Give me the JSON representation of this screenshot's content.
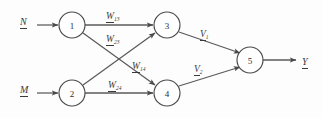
{
  "figure": {
    "width": 322,
    "height": 118,
    "background_color": "#fdfdfd",
    "line_color": "#5a5a5a",
    "text_color": "#3a3a3a"
  },
  "inputs": [
    {
      "name": "input-n",
      "label": "N",
      "underlined": true,
      "x": 24,
      "y": 18
    },
    {
      "name": "input-m",
      "label": "M",
      "underlined": true,
      "x": 24,
      "y": 86
    }
  ],
  "nodes": [
    {
      "id": "1",
      "label": "1",
      "cx": 72,
      "cy": 25,
      "r": 13
    },
    {
      "id": "2",
      "label": "2",
      "cx": 72,
      "cy": 93,
      "r": 13
    },
    {
      "id": "3",
      "label": "3",
      "cx": 167,
      "cy": 25,
      "r": 13
    },
    {
      "id": "4",
      "label": "4",
      "cx": 167,
      "cy": 93,
      "r": 13
    },
    {
      "id": "5",
      "label": "5",
      "cx": 250,
      "cy": 60,
      "r": 13
    }
  ],
  "weights": [
    {
      "name": "weight-w13",
      "base": "W",
      "sub": "13",
      "from": "1",
      "to": "3",
      "x": 112,
      "y": 7
    },
    {
      "name": "weight-w23",
      "base": "W",
      "sub": "23",
      "from": "2",
      "to": "3",
      "x": 112,
      "y": 30
    },
    {
      "name": "weight-w14",
      "base": "W",
      "sub": "14",
      "from": "1",
      "to": "4",
      "x": 138,
      "y": 57
    },
    {
      "name": "weight-w24",
      "base": "W",
      "sub": "24",
      "from": "2",
      "to": "4",
      "x": 114,
      "y": 76
    },
    {
      "name": "weight-v1",
      "base": "V",
      "sub": "1",
      "from": "3",
      "to": "5",
      "x": 204,
      "y": 25
    },
    {
      "name": "weight-v2",
      "base": "V",
      "sub": "2",
      "from": "4",
      "to": "5",
      "x": 198,
      "y": 60
    }
  ],
  "output": {
    "name": "output-y",
    "label": "Y",
    "underlined": true,
    "x": 305,
    "y": 53
  }
}
